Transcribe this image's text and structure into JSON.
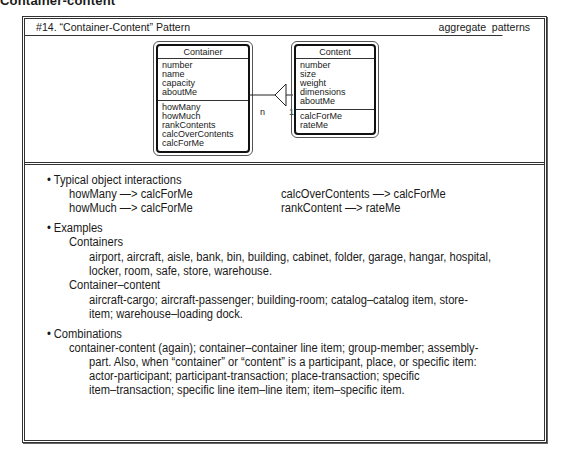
{
  "page_heading": "Container-content",
  "pattern": {
    "title": "#14. “Container-Content” Pattern",
    "category": "aggregate patterns"
  },
  "diagram": {
    "container": {
      "name": "Container",
      "attributes": [
        "number",
        "name",
        "capacity",
        "aboutMe"
      ],
      "methods": [
        "howMany",
        "howMuch",
        "rankContents",
        "calcOverContents",
        "calcForMe"
      ]
    },
    "content": {
      "name": "Content",
      "attributes": [
        "number",
        "size",
        "weight",
        "dimensions",
        "aboutMe"
      ],
      "methods": [
        "calcForMe",
        "rateMe"
      ]
    },
    "association": {
      "container_multiplicity": "n",
      "content_multiplicity": "1"
    }
  },
  "interactions": {
    "heading": "Typical object interactions",
    "left": [
      "howMany —> calcForMe",
      "howMuch —> calcForMe"
    ],
    "right": [
      "calcOverContents —> calcForMe",
      "rankContent —> rateMe"
    ]
  },
  "examples": {
    "heading": "Examples",
    "containers_label": "Containers",
    "containers_lines": [
      "airport, aircraft, aisle, bank, bin, building, cabinet, folder, garage, hangar, hospital,",
      "locker, room, safe, store, warehouse."
    ],
    "container_content_label": "Container–content",
    "container_content_lines": [
      "aircraft-cargo; aircraft-passenger; building-room; catalog–catalog item, store-",
      "item; warehouse–loading dock."
    ]
  },
  "combinations": {
    "heading": "Combinations",
    "lines": [
      "container-content (again); container–container line item; group-member; assembly-",
      "part. Also, when “container” or “content” is a participant, place, or specific item:",
      "actor-participant; participant-transaction; place-transaction; specific",
      "item–transaction; specific line item–line item; item–specific item."
    ]
  }
}
